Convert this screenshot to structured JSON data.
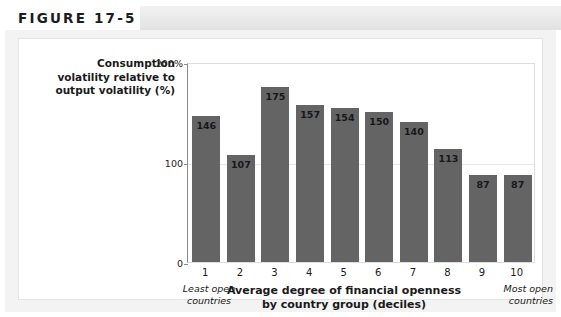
{
  "header": {
    "figure_label": "FIGURE 17-5"
  },
  "chart_data": {
    "type": "bar",
    "title": "",
    "ylabel": "Consumption volatility relative to output volatility (%)",
    "xlabel": "Average degree of financial openness by country group (deciles)",
    "xlabel_line1": "Average degree of financial openness",
    "xlabel_line2": "by country group (deciles)",
    "ylabel_line1": "Consumption",
    "ylabel_line2": "volatility relative to",
    "ylabel_line3": "output volatility (%)",
    "categories": [
      "1",
      "2",
      "3",
      "4",
      "5",
      "6",
      "7",
      "8",
      "9",
      "10"
    ],
    "values": [
      146,
      107,
      175,
      157,
      154,
      150,
      140,
      113,
      87,
      87
    ],
    "value_labels": [
      "146",
      "107",
      "175",
      "157",
      "154",
      "150",
      "140",
      "113",
      "87",
      "87"
    ],
    "ylim": [
      0,
      200
    ],
    "ytick_labels": [
      "200%",
      "100",
      "0"
    ],
    "ytick_values": [
      200,
      100,
      0
    ],
    "grid": true,
    "legend": false,
    "bar_color": "#646464",
    "annotation_left_line1": "Least open",
    "annotation_left_line2": "countries",
    "annotation_right_line1": "Most open",
    "annotation_right_line2": "countries"
  }
}
